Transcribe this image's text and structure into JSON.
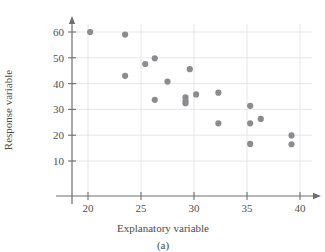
{
  "chart_data": {
    "type": "scatter",
    "title": "",
    "caption": "(a)",
    "xlabel": "Explanatory variable",
    "ylabel": "Response variable",
    "xlim": [
      15,
      41.5
    ],
    "ylim": [
      0,
      65
    ],
    "xticks": [
      20,
      25,
      30,
      35,
      40
    ],
    "yticks": [
      10,
      20,
      30,
      40,
      50,
      60
    ],
    "xtick_labels": [
      "20",
      "25",
      "30",
      "35",
      "40"
    ],
    "ytick_labels": [
      "10",
      "20",
      "30",
      "40",
      "50",
      "60"
    ],
    "grid": true,
    "grid_orientation": "both",
    "legend": "none",
    "marker": "filled-circle",
    "marker_color": "#8b8b90",
    "axis_color": "#6e6e6e",
    "grid_color": "#e4e4e4",
    "n_points": 20,
    "relationship": "negative linear association",
    "x": [
      20.2,
      23.5,
      23.5,
      25.4,
      26.3,
      26.3,
      27.5,
      29.2,
      29.2,
      29.2,
      30.2,
      32.3,
      32.3,
      35.3,
      35.3,
      35.3,
      36.3,
      39.2,
      39.2,
      29.6
    ],
    "y": [
      60.0,
      59.0,
      43.0,
      47.6,
      49.8,
      33.7,
      40.8,
      34.7,
      33.3,
      32.4,
      35.8,
      36.5,
      24.6,
      31.4,
      24.6,
      16.6,
      26.3,
      19.9,
      16.5,
      45.6
    ],
    "points": [
      {
        "x": 20.2,
        "y": 60.0
      },
      {
        "x": 23.5,
        "y": 59.0
      },
      {
        "x": 23.5,
        "y": 43.0
      },
      {
        "x": 25.4,
        "y": 47.6
      },
      {
        "x": 26.3,
        "y": 49.8
      },
      {
        "x": 26.3,
        "y": 33.7
      },
      {
        "x": 27.5,
        "y": 40.8
      },
      {
        "x": 29.6,
        "y": 45.6
      },
      {
        "x": 29.2,
        "y": 34.7
      },
      {
        "x": 29.2,
        "y": 33.3
      },
      {
        "x": 29.2,
        "y": 32.4
      },
      {
        "x": 30.2,
        "y": 35.8
      },
      {
        "x": 32.3,
        "y": 36.5
      },
      {
        "x": 32.3,
        "y": 24.6
      },
      {
        "x": 35.3,
        "y": 31.4
      },
      {
        "x": 35.3,
        "y": 24.6
      },
      {
        "x": 35.3,
        "y": 16.6
      },
      {
        "x": 36.3,
        "y": 26.3
      },
      {
        "x": 39.2,
        "y": 19.9
      },
      {
        "x": 39.2,
        "y": 16.5
      }
    ]
  }
}
